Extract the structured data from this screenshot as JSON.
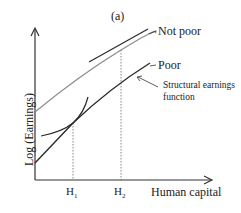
{
  "figure": {
    "panel_label": "(a)",
    "y_axis_label": "Log (Earnings)",
    "x_axis_label": "Human capital",
    "x_ticks": [
      {
        "base": "H",
        "sub": "1"
      },
      {
        "base": "H",
        "sub": "2"
      }
    ],
    "curves": [
      {
        "name": "Not poor",
        "color": "#8a8a8a"
      },
      {
        "name": "Poor",
        "color": "#2a2a2a"
      }
    ],
    "annotation": {
      "line1": "Structural earnings",
      "line2": "function"
    }
  }
}
